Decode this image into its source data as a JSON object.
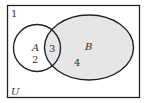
{
  "diagram": {
    "type": "venn",
    "universe_label": "U",
    "sets": [
      {
        "name": "A",
        "label": "A",
        "shaded": false
      },
      {
        "name": "B",
        "label": "B",
        "shaded": true
      }
    ],
    "regions": {
      "outside": "1",
      "a_only": "2",
      "a_and_b": "3",
      "b_only": "4"
    },
    "colors": {
      "stroke": "#222222",
      "shade": "#e6e6e6",
      "background": "#ffffff"
    }
  }
}
